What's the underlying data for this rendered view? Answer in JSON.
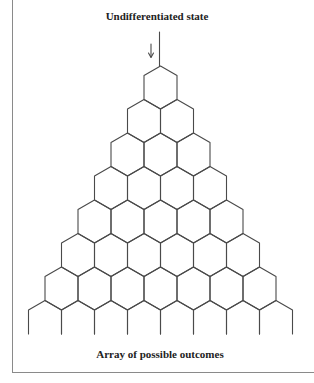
{
  "diagram": {
    "title": "Undifferentiated state",
    "caption": "Array of possible outcomes",
    "arrow_icon": "down-arrow",
    "structure": "hexagonal-branching-triangle",
    "closed_rows": 7,
    "open_bottom_row_cells": 8,
    "line_color": "#4a4a4a"
  }
}
